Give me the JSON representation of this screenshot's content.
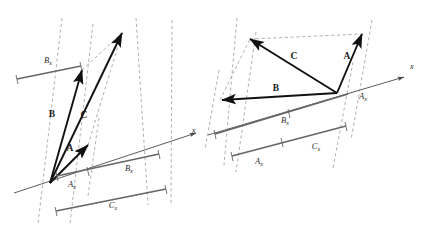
{
  "figure": {
    "title": "",
    "colors": {
      "vector": "#111111",
      "axis": "#4a4a4a",
      "dashed": "#8f8f8f",
      "measure_bar": "#666666",
      "background": "#ffffff"
    },
    "panels": [
      {
        "id": "left-panel",
        "name": "vector-addition-both-positive",
        "axis": {
          "label": "x",
          "label_x": 192,
          "label_y": 133
        },
        "origin": {
          "x": 50,
          "y": 183
        },
        "vectors": [
          {
            "name": "A",
            "label": "A",
            "label_x": 70,
            "label_y": 151,
            "tip_x": 88,
            "tip_y": 145
          },
          {
            "name": "B",
            "label": "B",
            "label_x": 52,
            "label_y": 117,
            "tip_x": 82,
            "tip_y": 70
          },
          {
            "name": "C",
            "label": "C",
            "label_x": 84,
            "label_y": 118,
            "tip_x": 122,
            "tip_y": 33
          }
        ],
        "components": [
          {
            "name": "Bx-upper",
            "base": "B",
            "sub": "x",
            "label_x": 48,
            "label_y": 63
          },
          {
            "name": "Ax-lower",
            "base": "A",
            "sub": "x",
            "label_x": 72,
            "label_y": 187
          },
          {
            "name": "Bx-lower",
            "base": "B",
            "sub": "x",
            "label_x": 129,
            "label_y": 171
          },
          {
            "name": "Cx-lower",
            "base": "C",
            "sub": "x",
            "label_x": 113,
            "label_y": 208
          }
        ]
      },
      {
        "id": "right-panel",
        "name": "vector-addition-one-negative",
        "axis": {
          "label": "x",
          "label_x": 410,
          "label_y": 69
        },
        "origin": {
          "x": 337,
          "y": 93
        },
        "vectors": [
          {
            "name": "A",
            "label": "A",
            "label_x": 347,
            "label_y": 59,
            "tip_x": 362,
            "tip_y": 34
          },
          {
            "name": "B",
            "label": "B",
            "label_x": 276,
            "label_y": 91,
            "tip_x": 220,
            "tip_y": 100
          },
          {
            "name": "C",
            "label": "C",
            "label_x": 294,
            "label_y": 59,
            "tip_x": 250,
            "tip_y": 39
          }
        ],
        "components": [
          {
            "name": "Ax-upper",
            "base": "A",
            "sub": "x",
            "label_x": 363,
            "label_y": 99
          },
          {
            "name": "Bx-lower",
            "base": "B",
            "sub": "x",
            "label_x": 285,
            "label_y": 123
          },
          {
            "name": "Cx-lower",
            "base": "C",
            "sub": "x",
            "label_x": 316,
            "label_y": 149
          },
          {
            "name": "Ax-lower",
            "base": "A",
            "sub": "x",
            "label_x": 259,
            "label_y": 164
          }
        ]
      }
    ]
  }
}
